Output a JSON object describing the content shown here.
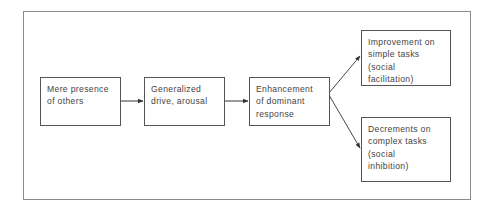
{
  "diagram": {
    "title": "",
    "nodes": [
      {
        "id": "mere-presence",
        "lines": [
          "Mere presence",
          "of others"
        ]
      },
      {
        "id": "generalized-drive",
        "lines": [
          "Generalized",
          "drive, arousal"
        ]
      },
      {
        "id": "enhancement",
        "lines": [
          "Enhancement",
          "of dominant",
          "response"
        ]
      },
      {
        "id": "improvement",
        "lines": [
          "Improvement on",
          "simple tasks",
          "(social",
          "facilitation)"
        ]
      },
      {
        "id": "decrements",
        "lines": [
          "Decrements on",
          "complex tasks",
          "(social",
          "inhibition)"
        ]
      }
    ],
    "edges": [
      {
        "from": "mere-presence",
        "to": "generalized-drive"
      },
      {
        "from": "generalized-drive",
        "to": "enhancement"
      },
      {
        "from": "enhancement",
        "to": "improvement"
      },
      {
        "from": "enhancement",
        "to": "decrements"
      }
    ],
    "colors": {
      "border": "#555555",
      "text": "#444444",
      "frame": "#8a8a8a",
      "arrow": "#333333"
    }
  }
}
